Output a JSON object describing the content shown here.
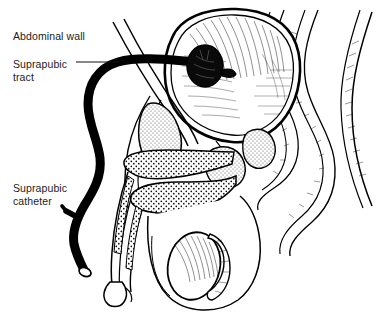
{
  "figure": {
    "type": "medical-line-illustration",
    "background_color": "#ffffff",
    "ink_color": "#000000",
    "text_color": "#1c1c1c"
  },
  "labels": [
    {
      "id": "abdominal-wall",
      "text": "Abdominal wall",
      "lines": [
        "Abdominal wall"
      ],
      "x": 13,
      "y": 30,
      "leader": "none"
    },
    {
      "id": "suprapubic-tract",
      "text": "Suprapubic tract",
      "lines": [
        "Suprapubic",
        "tract"
      ],
      "x": 13,
      "y": 58,
      "leader": "horizontal"
    },
    {
      "id": "suprapubic-catheter",
      "text": "Suprapubic catheter",
      "lines": [
        "Suprapubic",
        "catheter"
      ],
      "x": 13,
      "y": 182,
      "leader": "none"
    }
  ],
  "anatomy": [
    {
      "id": "bladder",
      "name": "Bladder"
    },
    {
      "id": "abdominal-wall-layer",
      "name": "Abdominal wall"
    },
    {
      "id": "pubic-bone",
      "name": "Pubic bone"
    },
    {
      "id": "prostate",
      "name": "Prostate"
    },
    {
      "id": "seminal-vesicle",
      "name": "Seminal vesicle"
    },
    {
      "id": "rectum",
      "name": "Rectum"
    },
    {
      "id": "sacrum",
      "name": "Sacrum"
    },
    {
      "id": "corpus-cavernosum",
      "name": "Corpus cavernosum"
    },
    {
      "id": "corpus-spongiosum",
      "name": "Corpus spongiosum"
    },
    {
      "id": "urethra",
      "name": "Urethra"
    },
    {
      "id": "glans-penis",
      "name": "Glans penis"
    },
    {
      "id": "testis",
      "name": "Testis"
    },
    {
      "id": "scrotum",
      "name": "Scrotum"
    }
  ],
  "device": {
    "id": "catheter",
    "name": "Suprapubic catheter",
    "balloon": "Inflated retention balloon inside bladder",
    "tip": "Open drainage tip",
    "side_port": "Drainage side branch"
  }
}
